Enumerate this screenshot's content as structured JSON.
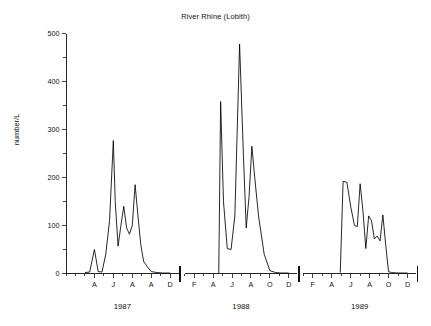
{
  "chart_data": {
    "type": "line",
    "title": "River Rhine (Lobith)",
    "xlabel": "",
    "ylabel": "number/L",
    "ylim": [
      0,
      500
    ],
    "yticks": [
      0,
      100,
      200,
      300,
      400,
      500
    ],
    "ytick_labels": [
      "0",
      "100",
      "200",
      "300",
      "400",
      "500"
    ],
    "yminor_step": 50,
    "grid": false,
    "legend": "none",
    "panels": [
      {
        "year": "1987",
        "xtick_labels": [
          "A",
          "J",
          "A",
          "A",
          "D"
        ],
        "xtick_months": [
          4,
          6,
          8,
          10,
          12
        ],
        "x": [
          3.0,
          3.5,
          4.0,
          4.4,
          4.8,
          5.2,
          5.6,
          6.0,
          6.2,
          6.5,
          6.8,
          7.1,
          7.4,
          7.7,
          8.0,
          8.3,
          8.6,
          8.9,
          9.2,
          9.6,
          10.0,
          10.6,
          11.2,
          12.0
        ],
        "y": [
          2,
          3,
          50,
          4,
          3,
          40,
          110,
          277,
          150,
          57,
          100,
          140,
          95,
          82,
          100,
          185,
          120,
          60,
          25,
          14,
          4,
          2,
          1,
          1
        ]
      },
      {
        "year": "1988",
        "xtick_labels": [
          "F",
          "A",
          "J",
          "A",
          "O",
          "D"
        ],
        "xtick_months": [
          2,
          4,
          6,
          8,
          10,
          12
        ],
        "x": [
          4.6,
          4.8,
          5.1,
          5.5,
          5.9,
          6.3,
          6.8,
          7.2,
          7.5,
          7.8,
          8.1,
          8.4,
          8.8,
          9.4,
          10.0,
          10.6,
          11.2,
          12.0
        ],
        "y": [
          1,
          358,
          150,
          52,
          50,
          120,
          478,
          250,
          95,
          160,
          265,
          200,
          120,
          40,
          6,
          2,
          1,
          1
        ]
      },
      {
        "year": "1989",
        "xtick_labels": [
          "F",
          "A",
          "J",
          "A",
          "O",
          "D"
        ],
        "xtick_months": [
          2,
          4,
          6,
          8,
          10,
          12
        ],
        "x": [
          4.9,
          5.2,
          5.6,
          6.0,
          6.4,
          6.7,
          7.0,
          7.3,
          7.6,
          7.9,
          8.2,
          8.5,
          8.8,
          9.1,
          9.4,
          9.7,
          10.0,
          10.3,
          11.0,
          12.0
        ],
        "y": [
          2,
          192,
          190,
          140,
          100,
          98,
          187,
          130,
          52,
          120,
          110,
          72,
          78,
          68,
          122,
          60,
          4,
          2,
          1,
          1
        ]
      }
    ]
  },
  "axis": {
    "y_axis_name": "number/L",
    "y_max_label": "500",
    "y_min_label": "0"
  },
  "years": {
    "first": "1987",
    "second": "1988",
    "third": "1989"
  }
}
